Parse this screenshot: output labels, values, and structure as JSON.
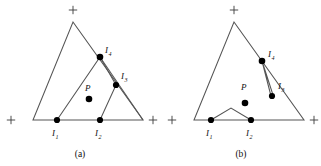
{
  "figure": {
    "panels": [
      {
        "id": "a",
        "caption": "(a)",
        "caption_x": 80,
        "caption_y": 157,
        "outer_triangle": {
          "name": "outer-triangle",
          "points": "73,22 143,120 33,120"
        },
        "corner_markers": [
          {
            "name": "plus-marker-apex",
            "cx": 73,
            "cy": 10
          },
          {
            "name": "plus-marker-bottom-left",
            "cx": 11,
            "cy": 120
          },
          {
            "name": "plus-marker-bottom-right",
            "cx": 153,
            "cy": 120
          }
        ],
        "inner_path": {
          "name": "inner-polyline",
          "points": "57,120 100,57 116,85 100,120"
        },
        "extra_edges": [
          {
            "name": "edge-i4-to-bottom-right",
            "points": "100,57 143,120"
          }
        ],
        "vertices": [
          {
            "name": "vertex-i1",
            "label": "I",
            "sub": "1",
            "cx": 57,
            "cy": 120,
            "r": 3.1,
            "lx": 52,
            "ly": 136
          },
          {
            "name": "vertex-i2",
            "label": "I",
            "sub": "2",
            "cx": 100,
            "cy": 120,
            "r": 3.1,
            "lx": 95,
            "ly": 136
          },
          {
            "name": "vertex-i3",
            "label": "I",
            "sub": "3",
            "cx": 116,
            "cy": 85,
            "r": 3.1,
            "lx": 121,
            "ly": 79
          },
          {
            "name": "vertex-i4",
            "label": "I",
            "sub": "4",
            "cx": 100,
            "cy": 57,
            "r": 3.3,
            "lx": 105,
            "ly": 53
          }
        ],
        "point_p": {
          "name": "point-p",
          "label": "P",
          "cx": 89,
          "cy": 99,
          "r": 3.3,
          "lx": 85,
          "ly": 91
        }
      },
      {
        "id": "b",
        "caption": "(b)",
        "caption_x": 80,
        "caption_y": 157,
        "outer_triangle": {
          "name": "outer-triangle",
          "points": "73,22 143,120 33,120"
        },
        "corner_markers": [
          {
            "name": "plus-marker-apex",
            "cx": 73,
            "cy": 10
          },
          {
            "name": "plus-marker-bottom-left",
            "cx": 11,
            "cy": 120
          },
          {
            "name": "plus-marker-bottom-right",
            "cx": 153,
            "cy": 120
          }
        ],
        "inner_path": {
          "name": "inner-polyline",
          "points": "50,120 70,108 90,120"
        },
        "extra_edges": [
          {
            "name": "edge-wedge-i4-i3",
            "points": "110,96 101,61 112,95"
          }
        ],
        "vertices": [
          {
            "name": "vertex-i1",
            "label": "I",
            "sub": "1",
            "cx": 50,
            "cy": 120,
            "r": 3.1,
            "lx": 45,
            "ly": 136
          },
          {
            "name": "vertex-i2",
            "label": "I",
            "sub": "2",
            "cx": 90,
            "cy": 120,
            "r": 3.1,
            "lx": 85,
            "ly": 136
          },
          {
            "name": "vertex-i3",
            "label": "I",
            "sub": "3",
            "cx": 111,
            "cy": 96,
            "r": 3.1,
            "lx": 117,
            "ly": 89
          },
          {
            "name": "vertex-i4",
            "label": "I",
            "sub": "4",
            "cx": 101,
            "cy": 61,
            "r": 3.3,
            "lx": 107,
            "ly": 57
          }
        ],
        "point_p": {
          "name": "point-p",
          "label": "P",
          "cx": 84,
          "cy": 103,
          "r": 3.3,
          "lx": 80,
          "ly": 90
        }
      }
    ]
  },
  "style": {
    "line_color": "#555555",
    "dot_color": "#000000",
    "text_color": "#111111",
    "background": "#ffffff"
  }
}
